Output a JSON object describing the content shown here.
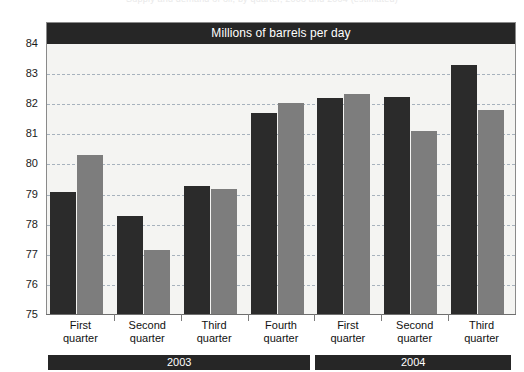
{
  "top_caption": "Supply and demand of oil, by quarter, 2003 and 2004 (estimated)",
  "chart_data": {
    "type": "bar",
    "title": "Millions of barrels per day",
    "xlabel": "",
    "ylabel": "",
    "ylim": [
      75,
      84
    ],
    "yticks": [
      75,
      76,
      77,
      78,
      79,
      80,
      81,
      82,
      83,
      84
    ],
    "grid": true,
    "legend_position": "none",
    "categories": [
      "First quarter",
      "Second quarter",
      "Third quarter",
      "Fourth quarter",
      "First quarter",
      "Second quarter",
      "Third quarter"
    ],
    "group_bands": [
      {
        "label": "2003",
        "span": 4
      },
      {
        "label": "2004",
        "span": 3
      }
    ],
    "series": [
      {
        "name": "series-1",
        "color": "#2b2b2b",
        "values": [
          79.1,
          78.3,
          79.3,
          81.7,
          82.2,
          82.25,
          83.3
        ]
      },
      {
        "name": "series-2",
        "color": "#7d7d7d",
        "values": [
          80.3,
          77.15,
          79.2,
          82.05,
          82.35,
          81.1,
          81.8
        ]
      }
    ]
  },
  "colors": {
    "title_bar": "#262626",
    "plot_background": "#f4f4f2",
    "gridline": "#9aa7b4",
    "series_1": "#2b2b2b",
    "series_2": "#7d7d7d"
  }
}
